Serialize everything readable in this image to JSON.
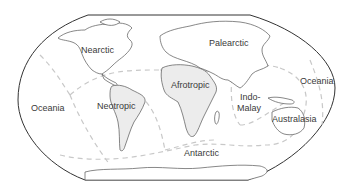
{
  "map": {
    "colors": {
      "background": "#ffffff",
      "ocean": "#ffffff",
      "land": "#ffffff",
      "land_highlight": "#ececec",
      "coastline": "#555555",
      "frame": "#333333",
      "region_boundary": "#c8c8c8",
      "label": "#3a3a3a"
    },
    "regions": [
      {
        "id": "nearctic",
        "label": "Nearctic"
      },
      {
        "id": "palearctic",
        "label": "Palearctic"
      },
      {
        "id": "afrotropic",
        "label": "Afrotropic"
      },
      {
        "id": "neotropic",
        "label": "Neotropic"
      },
      {
        "id": "indo-malay",
        "label_line1": "Indo-",
        "label_line2": "Malay"
      },
      {
        "id": "australasia",
        "label": "Australasia"
      },
      {
        "id": "oceania-west",
        "label": "Oceania"
      },
      {
        "id": "oceania-east",
        "label": "Oceania"
      },
      {
        "id": "antarctic",
        "label": "Antarctic"
      }
    ]
  }
}
